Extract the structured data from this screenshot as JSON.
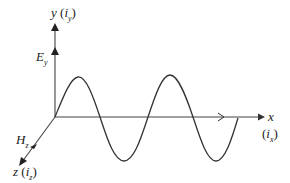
{
  "diagram": {
    "axes": {
      "y": {
        "label": "y",
        "unit_vector": "i",
        "unit_sub": "y"
      },
      "x": {
        "label": "x",
        "unit_vector": "i",
        "unit_sub": "x"
      },
      "z": {
        "label": "z",
        "unit_vector": "i",
        "unit_sub": "z"
      }
    },
    "fields": {
      "electric": {
        "symbol": "E",
        "sub": "y"
      },
      "magnetic": {
        "symbol": "H",
        "sub": "z"
      }
    },
    "wave": {
      "cycles": 2,
      "direction": "+x"
    },
    "colors": {
      "line": "#333333",
      "background": "#ffffff"
    }
  }
}
